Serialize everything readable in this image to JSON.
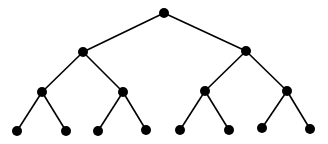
{
  "diagram": {
    "type": "binary-tree",
    "depth": 3,
    "colors": {
      "node": "#000000",
      "edge": "#000000",
      "background": "#ffffff"
    },
    "node_radius": 5,
    "nodes": [
      {
        "id": "n0",
        "x": 164,
        "y": 13
      },
      {
        "id": "n1",
        "x": 83,
        "y": 52
      },
      {
        "id": "n2",
        "x": 246,
        "y": 51
      },
      {
        "id": "n3",
        "x": 42,
        "y": 92
      },
      {
        "id": "n4",
        "x": 123,
        "y": 92
      },
      {
        "id": "n5",
        "x": 205,
        "y": 91
      },
      {
        "id": "n6",
        "x": 287,
        "y": 91
      },
      {
        "id": "n7",
        "x": 17,
        "y": 131
      },
      {
        "id": "n8",
        "x": 66,
        "y": 131
      },
      {
        "id": "n9",
        "x": 98,
        "y": 131
      },
      {
        "id": "n10",
        "x": 146,
        "y": 130
      },
      {
        "id": "n11",
        "x": 180,
        "y": 130
      },
      {
        "id": "n12",
        "x": 229,
        "y": 130
      },
      {
        "id": "n13",
        "x": 262,
        "y": 128
      },
      {
        "id": "n14",
        "x": 310,
        "y": 129
      }
    ],
    "edges": [
      [
        "n0",
        "n1"
      ],
      [
        "n0",
        "n2"
      ],
      [
        "n1",
        "n3"
      ],
      [
        "n1",
        "n4"
      ],
      [
        "n2",
        "n5"
      ],
      [
        "n2",
        "n6"
      ],
      [
        "n3",
        "n7"
      ],
      [
        "n3",
        "n8"
      ],
      [
        "n4",
        "n9"
      ],
      [
        "n4",
        "n10"
      ],
      [
        "n5",
        "n11"
      ],
      [
        "n5",
        "n12"
      ],
      [
        "n6",
        "n13"
      ],
      [
        "n6",
        "n14"
      ]
    ]
  }
}
